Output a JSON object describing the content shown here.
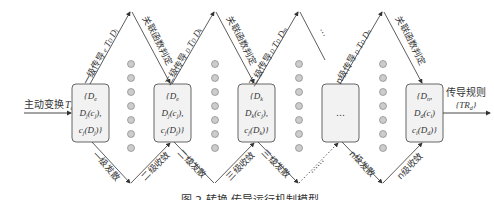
{
  "input": {
    "label": "主动变换",
    "symbol": "T_a D_i"
  },
  "output": {
    "label": "传导规则",
    "symbol": "{TR_d}"
  },
  "boxes": [
    {
      "lines": [
        "{D_e,",
        "D_j(c_j),",
        "c_j(D_j)}"
      ]
    },
    {
      "lines": [
        "{D_e,",
        "D_j(c_j),",
        "c_j(D_j)}"
      ]
    },
    {
      "lines": [
        "{D_k,",
        "D_k(c_j),",
        "c_j(D_k)}"
      ]
    },
    {
      "lines": [
        "…"
      ]
    },
    {
      "lines": [
        "{D_n,",
        "D_d(c_i)",
        "c_i(D_d)}"
      ]
    }
  ],
  "upper_labels": [
    {
      "text": "一级传导",
      "sub": "e T_D_i D_j"
    },
    {
      "text": "关联函数判定"
    },
    {
      "text": "二级传导",
      "sub": "D_j T_D_j D_k"
    },
    {
      "text": "关联函数判定"
    },
    {
      "text": "三级传导",
      "sub": "D_k T_D_k D_m"
    },
    {
      "text": "…"
    },
    {
      "text": "n级传导",
      "sub": "D_j T_D_j D_n"
    },
    {
      "text": "关联函数判定"
    }
  ],
  "lower_labels": [
    {
      "text": "一级发散"
    },
    {
      "text": "二级收敛"
    },
    {
      "text": "二级发散"
    },
    {
      "text": "三级收敛"
    },
    {
      "text": "三级发散"
    },
    {
      "text": "……"
    },
    {
      "text": "n级发散"
    },
    {
      "text": "n级收敛"
    }
  ],
  "caption": "图 2 转换-传导运行机制模型",
  "colors": {
    "line": "#333333",
    "box_fill": "#f2f2f2",
    "dot_fill": "#cccccc"
  }
}
